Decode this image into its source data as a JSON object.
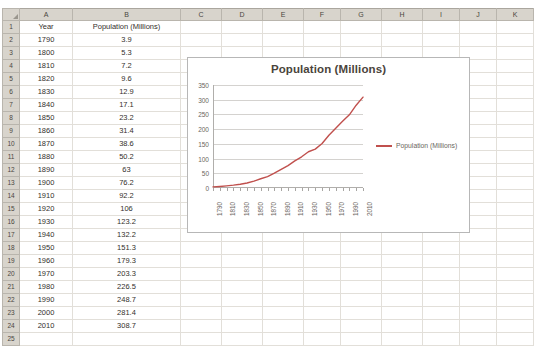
{
  "spreadsheet": {
    "column_headers": [
      "A",
      "B",
      "C",
      "D",
      "E",
      "F",
      "G",
      "H",
      "I",
      "J",
      "K"
    ],
    "row_numbers": [
      "1",
      "2",
      "3",
      "4",
      "5",
      "6",
      "7",
      "8",
      "9",
      "10",
      "11",
      "12",
      "13",
      "14",
      "15",
      "16",
      "17",
      "18",
      "19",
      "20",
      "21",
      "22",
      "23",
      "24",
      "25"
    ],
    "header_row": {
      "a": "Year",
      "b": "Population (Millions)"
    },
    "rows": [
      {
        "row": "2",
        "a": "1790",
        "b": "3.9"
      },
      {
        "row": "3",
        "a": "1800",
        "b": "5.3"
      },
      {
        "row": "4",
        "a": "1810",
        "b": "7.2"
      },
      {
        "row": "5",
        "a": "1820",
        "b": "9.6"
      },
      {
        "row": "6",
        "a": "1830",
        "b": "12.9"
      },
      {
        "row": "7",
        "a": "1840",
        "b": "17.1"
      },
      {
        "row": "8",
        "a": "1850",
        "b": "23.2"
      },
      {
        "row": "9",
        "a": "1860",
        "b": "31.4"
      },
      {
        "row": "10",
        "a": "1870",
        "b": "38.6"
      },
      {
        "row": "11",
        "a": "1880",
        "b": "50.2"
      },
      {
        "row": "12",
        "a": "1890",
        "b": "63"
      },
      {
        "row": "13",
        "a": "1900",
        "b": "76.2"
      },
      {
        "row": "14",
        "a": "1910",
        "b": "92.2"
      },
      {
        "row": "15",
        "a": "1920",
        "b": "106"
      },
      {
        "row": "16",
        "a": "1930",
        "b": "123.2"
      },
      {
        "row": "17",
        "a": "1940",
        "b": "132.2"
      },
      {
        "row": "18",
        "a": "1950",
        "b": "151.3"
      },
      {
        "row": "19",
        "a": "1960",
        "b": "179.3"
      },
      {
        "row": "20",
        "a": "1970",
        "b": "203.3"
      },
      {
        "row": "21",
        "a": "1980",
        "b": "226.5"
      },
      {
        "row": "22",
        "a": "1990",
        "b": "248.7"
      },
      {
        "row": "23",
        "a": "2000",
        "b": "281.4"
      },
      {
        "row": "24",
        "a": "2010",
        "b": "308.7"
      },
      {
        "row": "25",
        "a": "",
        "b": ""
      }
    ]
  },
  "chart_data": {
    "type": "line",
    "title": "Population (Millions)",
    "xlabel": "",
    "ylabel": "",
    "ylim": [
      0,
      350
    ],
    "ytick_labels": [
      "0",
      "50",
      "100",
      "150",
      "200",
      "250",
      "300",
      "350"
    ],
    "ytick_values": [
      0,
      50,
      100,
      150,
      200,
      250,
      300,
      350
    ],
    "grid": true,
    "legend_position": "right",
    "x": [
      1790,
      1800,
      1810,
      1820,
      1830,
      1840,
      1850,
      1860,
      1870,
      1880,
      1890,
      1900,
      1910,
      1920,
      1930,
      1940,
      1950,
      1960,
      1970,
      1980,
      1990,
      2000,
      2010
    ],
    "xtick_labels": [
      "1790",
      "1810",
      "1830",
      "1850",
      "1870",
      "1890",
      "1910",
      "1930",
      "1950",
      "1970",
      "1990",
      "2010"
    ],
    "series": [
      {
        "name": "Population (Millions)",
        "color": "#c0504d",
        "values": [
          3.9,
          5.3,
          7.2,
          9.6,
          12.9,
          17.1,
          23.2,
          31.4,
          38.6,
          50.2,
          63,
          76.2,
          92.2,
          106,
          123.2,
          132.2,
          151.3,
          179.3,
          203.3,
          226.5,
          248.7,
          281.4,
          308.7
        ]
      }
    ]
  },
  "colors": {
    "series_line": "#c0504d",
    "header_fill": "#d8d4cc",
    "gridline": "#e2dfd9",
    "text": "#332f2b"
  }
}
